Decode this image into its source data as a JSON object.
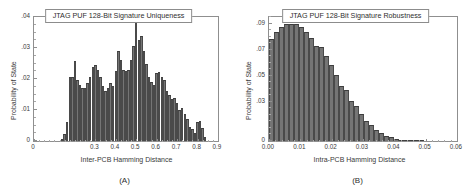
{
  "figure": {
    "background": "#ffffff",
    "bar_color": "#757575",
    "bar_edge_color": "#3d3d3d",
    "axis_color": "#8f8f8f"
  },
  "chart_data": [
    {
      "type": "bar",
      "panel": "A",
      "title": "JTAG PUF 128-Bit Signature Uniqueness",
      "xlabel": "Inter-PCB Hamming Distance",
      "ylabel": "Probability of State",
      "subcaption": "(A)",
      "grid": false,
      "legend": "none",
      "xlim": [
        0,
        0.9
      ],
      "ylim": [
        0,
        0.04
      ],
      "xticks": [
        0,
        0.3,
        0.4,
        0.5,
        0.6,
        0.7,
        0.8,
        0.9
      ],
      "xtick_labels": [
        "0",
        "0.3",
        "0.4",
        "0.5",
        "0.6",
        "0.7",
        "0.8",
        "0.9"
      ],
      "yticks": [
        0,
        0.01,
        0.02,
        0.03,
        0.04
      ],
      "ytick_labels": [
        "0",
        ".01",
        ".02",
        ".03",
        ".04"
      ],
      "bin_width": 0.0125,
      "x": [
        0.1375,
        0.15,
        0.1625,
        0.175,
        0.1875,
        0.2,
        0.2125,
        0.225,
        0.2375,
        0.25,
        0.2625,
        0.275,
        0.2875,
        0.3,
        0.3125,
        0.325,
        0.3375,
        0.35,
        0.3625,
        0.375,
        0.3875,
        0.4,
        0.4125,
        0.425,
        0.4375,
        0.45,
        0.4625,
        0.475,
        0.4875,
        0.5,
        0.5125,
        0.525,
        0.5375,
        0.55,
        0.5625,
        0.575,
        0.5875,
        0.6,
        0.6125,
        0.625,
        0.6375,
        0.65,
        0.6625,
        0.675,
        0.6875,
        0.7,
        0.7125,
        0.725,
        0.7375,
        0.75,
        0.7625,
        0.775,
        0.7875,
        0.8,
        0.8125,
        0.825,
        0.8375
      ],
      "values": [
        0.0008,
        0.0022,
        0.0062,
        0.0205,
        0.0208,
        0.0257,
        0.0196,
        0.0181,
        0.017,
        0.0172,
        0.0188,
        0.0207,
        0.0238,
        0.0245,
        0.0228,
        0.0205,
        0.0178,
        0.016,
        0.0172,
        0.0186,
        0.0178,
        0.0225,
        0.029,
        0.0262,
        0.0228,
        0.0226,
        0.0228,
        0.0262,
        0.0308,
        0.0386,
        0.0325,
        0.034,
        0.029,
        0.025,
        0.0206,
        0.019,
        0.0182,
        0.0218,
        0.0224,
        0.0205,
        0.0196,
        0.016,
        0.0148,
        0.0136,
        0.014,
        0.0122,
        0.01,
        0.0105,
        0.0086,
        0.007,
        0.0046,
        0.0038,
        0.0025,
        0.006,
        0.0064,
        0.0042,
        0.0012
      ]
    },
    {
      "type": "bar",
      "panel": "B",
      "title": "JTAG PUF 128-Bit Signature Robustness",
      "xlabel": "Intra-PCB Hamming Distance",
      "ylabel": "Probability of State",
      "subcaption": "(B)",
      "grid": false,
      "legend": "none",
      "xlim": [
        0,
        0.06
      ],
      "ylim": [
        0,
        0.095
      ],
      "xticks": [
        0,
        0.01,
        0.02,
        0.03,
        0.04,
        0.05,
        0.06
      ],
      "xtick_labels": [
        "0.00",
        "0.01",
        "0.02",
        "0.03",
        "0.04",
        "0.05",
        "0.06"
      ],
      "yticks": [
        0,
        0.03,
        0.05,
        0.07,
        0.09
      ],
      "ytick_labels": [
        "0",
        ".03",
        ".05",
        ".07",
        ".09"
      ],
      "bin_width": 0.0016,
      "x": [
        0.0008,
        0.0024,
        0.004,
        0.0056,
        0.0072,
        0.0088,
        0.0104,
        0.012,
        0.0136,
        0.0152,
        0.0168,
        0.0184,
        0.02,
        0.0216,
        0.0232,
        0.0248,
        0.0264,
        0.028,
        0.0296,
        0.0312,
        0.0328,
        0.0344,
        0.036,
        0.0376,
        0.0392,
        0.0408,
        0.0424,
        0.044,
        0.0456,
        0.0472,
        0.0488
      ],
      "values": [
        0.078,
        0.0838,
        0.0872,
        0.0894,
        0.09,
        0.0894,
        0.0872,
        0.0838,
        0.079,
        0.073,
        0.072,
        0.0652,
        0.058,
        0.0504,
        0.042,
        0.0392,
        0.031,
        0.0266,
        0.0205,
        0.015,
        0.012,
        0.0088,
        0.006,
        0.0042,
        0.0028,
        0.0016,
        0.001,
        0.0006,
        0.0004,
        0.0002,
        0.0001
      ]
    }
  ]
}
